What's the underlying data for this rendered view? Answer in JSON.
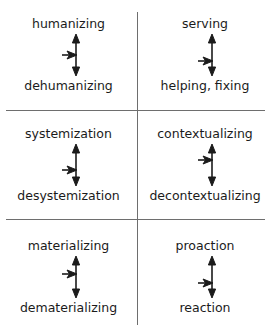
{
  "diagram": {
    "line_color": "#6e6e6e",
    "text_color": "#1b1b1b",
    "arrow_color": "#1b1b1b",
    "quadrants": [
      {
        "id": "humanizing-dehumanizing",
        "row": 1,
        "column": "left",
        "top_label": "humanizing",
        "bottom_label": "dehumanizing",
        "vertical_arrow": "double-headed-vertical-arrow",
        "side_arrow": "right-pointing-arrow",
        "side_arrow_position": "middle"
      },
      {
        "id": "serving-helping-fixing",
        "row": 1,
        "column": "right",
        "top_label": "serving",
        "bottom_label": "helping, fixing",
        "vertical_arrow": "double-headed-vertical-arrow",
        "side_arrow": "right-pointing-arrow",
        "side_arrow_position": "lower"
      },
      {
        "id": "systemization-desystemization",
        "row": 2,
        "column": "left",
        "top_label": "systemization",
        "bottom_label": "desystemization",
        "vertical_arrow": "double-headed-vertical-arrow",
        "side_arrow": "right-pointing-arrow",
        "side_arrow_position": "lower"
      },
      {
        "id": "contextualizing-decontextualizing",
        "row": 2,
        "column": "right",
        "top_label": "contextualizing",
        "bottom_label": "decontextualizing",
        "vertical_arrow": "double-headed-vertical-arrow",
        "side_arrow": "right-pointing-arrow",
        "side_arrow_position": "upper"
      },
      {
        "id": "materializing-dematerializing",
        "row": 3,
        "column": "left",
        "top_label": "materializing",
        "bottom_label": "dematerializing",
        "vertical_arrow": "double-headed-vertical-arrow",
        "side_arrow": "right-pointing-arrow",
        "side_arrow_position": "upper"
      },
      {
        "id": "proaction-reaction",
        "row": 3,
        "column": "right",
        "top_label": "proaction",
        "bottom_label": "reaction",
        "vertical_arrow": "double-headed-vertical-arrow",
        "side_arrow": "right-pointing-arrow",
        "side_arrow_position": "lower"
      }
    ]
  }
}
